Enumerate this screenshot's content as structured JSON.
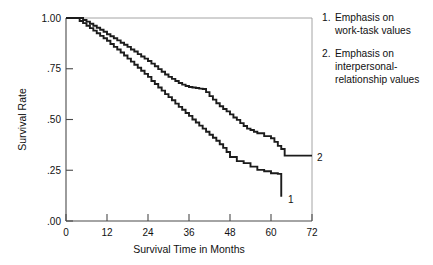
{
  "chart_data": {
    "type": "line",
    "title": "",
    "xlabel": "Survival Time in Months",
    "ylabel": "Survival Rate",
    "xlim": [
      0,
      72
    ],
    "ylim": [
      0,
      1.0
    ],
    "xticks": [
      0,
      12,
      24,
      36,
      48,
      60,
      72
    ],
    "xtick_labels": [
      "0",
      "12",
      "24",
      "36",
      "48",
      "60",
      "72"
    ],
    "yticks": [
      0.0,
      0.25,
      0.5,
      0.75,
      1.0
    ],
    "ytick_labels": [
      ".00",
      ".25",
      ".50",
      ".75",
      "1.00"
    ],
    "grid": false,
    "legend_position": "right",
    "series": [
      {
        "name": "1",
        "legend_label": "Emphasis on work-task values",
        "end_label": "1",
        "step": "post",
        "x": [
          0,
          3,
          4,
          5,
          6,
          7,
          8,
          9,
          10,
          11,
          12,
          13,
          14,
          15,
          16,
          17,
          18,
          19,
          20,
          21,
          22,
          23,
          24,
          25,
          26,
          27,
          28,
          29,
          30,
          31,
          32,
          33,
          34,
          35,
          36,
          37,
          38,
          39,
          40,
          41,
          42,
          43,
          44,
          45,
          46,
          47,
          48,
          50,
          52,
          54,
          56,
          58,
          60,
          62,
          63,
          63
        ],
        "y": [
          1.0,
          1.0,
          0.985,
          0.975,
          0.962,
          0.95,
          0.938,
          0.925,
          0.912,
          0.9,
          0.888,
          0.872,
          0.858,
          0.845,
          0.83,
          0.815,
          0.8,
          0.785,
          0.77,
          0.755,
          0.74,
          0.725,
          0.71,
          0.69,
          0.675,
          0.658,
          0.642,
          0.625,
          0.61,
          0.595,
          0.578,
          0.562,
          0.548,
          0.532,
          0.518,
          0.5,
          0.485,
          0.47,
          0.455,
          0.44,
          0.425,
          0.41,
          0.395,
          0.378,
          0.36,
          0.34,
          0.315,
          0.295,
          0.285,
          0.268,
          0.252,
          0.245,
          0.235,
          0.232,
          0.232,
          0.12
        ]
      },
      {
        "name": "2",
        "legend_label": "Emphasis on interpersonal-relationship values",
        "end_label": "2",
        "step": "post",
        "x": [
          0,
          4,
          5,
          6,
          7,
          8,
          9,
          10,
          11,
          12,
          13,
          14,
          15,
          16,
          17,
          18,
          19,
          20,
          21,
          22,
          23,
          24,
          25,
          26,
          27,
          28,
          29,
          30,
          31,
          32,
          33,
          34,
          35,
          36,
          37,
          38,
          39,
          40,
          41,
          42,
          43,
          44,
          45,
          46,
          47,
          48,
          49,
          50,
          51,
          52,
          53,
          54,
          55,
          56,
          58,
          60,
          61,
          62,
          63,
          64,
          72
        ],
        "y": [
          1.0,
          1.0,
          0.99,
          0.982,
          0.972,
          0.962,
          0.952,
          0.942,
          0.932,
          0.92,
          0.91,
          0.9,
          0.89,
          0.878,
          0.868,
          0.858,
          0.845,
          0.835,
          0.822,
          0.81,
          0.8,
          0.788,
          0.775,
          0.762,
          0.748,
          0.735,
          0.722,
          0.71,
          0.7,
          0.69,
          0.68,
          0.672,
          0.665,
          0.66,
          0.658,
          0.655,
          0.652,
          0.65,
          0.635,
          0.615,
          0.598,
          0.58,
          0.565,
          0.552,
          0.54,
          0.525,
          0.51,
          0.498,
          0.482,
          0.468,
          0.455,
          0.448,
          0.44,
          0.432,
          0.418,
          0.408,
          0.39,
          0.37,
          0.355,
          0.322,
          0.322
        ]
      }
    ],
    "annotations": [
      {
        "text": "1",
        "x": 63,
        "y": 0.12
      },
      {
        "text": "2",
        "x": 72,
        "y": 0.322
      }
    ]
  },
  "legend": {
    "entries": [
      {
        "number": "1.",
        "line1": "Emphasis on",
        "line2": "work-task values",
        "line3": ""
      },
      {
        "number": "2.",
        "line1": "Emphasis on",
        "line2": "interpersonal-",
        "line3": "relationship values"
      }
    ]
  },
  "colors": {
    "curve": "#1c1c1c",
    "axis": "#4a4a4a",
    "frame": "#9a9a9a",
    "text": "#111111",
    "background": "#ffffff"
  }
}
